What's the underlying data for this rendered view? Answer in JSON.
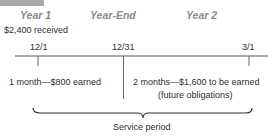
{
  "header": {
    "periods": [
      {
        "label": "Year 1",
        "x": 20
      },
      {
        "label": "Year-End",
        "x": 90
      },
      {
        "label": "Year 2",
        "x": 186
      }
    ],
    "cash_received": "$2,400 received"
  },
  "timeline": {
    "dates": [
      {
        "label": "12/1",
        "x": 38
      },
      {
        "label": "12/31",
        "x": 124
      },
      {
        "label": "3/1",
        "x": 249
      }
    ]
  },
  "segments": {
    "earned": "1 month—$800 earned",
    "unearned_line1": "2 months—$1,600 to be earned",
    "unearned_line2": "(future obligations)"
  },
  "brace": {
    "label": "Service period"
  },
  "colors": {
    "period_label": "#8a8a8a",
    "line": "#555555",
    "top_bar": "#a9a9a9"
  }
}
